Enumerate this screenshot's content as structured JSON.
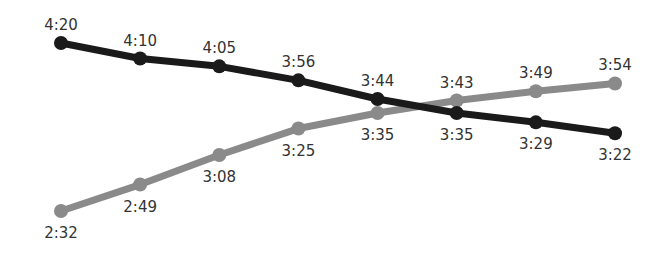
{
  "chart_data": {
    "type": "line",
    "title": "",
    "xlabel": "",
    "ylabel": "",
    "grid": false,
    "legend": null,
    "x": [
      1,
      2,
      3,
      4,
      5,
      6,
      7,
      8
    ],
    "series": [
      {
        "name": "dark-series",
        "color": "#1a1a1a",
        "labels": [
          "4:20",
          "4:10",
          "4:05",
          "3:56",
          "3:44",
          "3:35",
          "3:29",
          "3:22"
        ],
        "values_seconds": [
          260,
          250,
          245,
          236,
          224,
          215,
          209,
          202
        ],
        "label_position": [
          "above",
          "above",
          "above",
          "above",
          "above",
          "below",
          "below",
          "below"
        ]
      },
      {
        "name": "gray-series",
        "color": "#8a8a8a",
        "labels": [
          "2:32",
          "2:49",
          "3:08",
          "3:25",
          "3:35",
          "3:43",
          "3:49",
          "3:54"
        ],
        "values_seconds": [
          152,
          169,
          188,
          205,
          215,
          223,
          229,
          234
        ],
        "label_position": [
          "below",
          "below",
          "below",
          "below",
          "below",
          "above",
          "above",
          "above"
        ]
      }
    ]
  }
}
